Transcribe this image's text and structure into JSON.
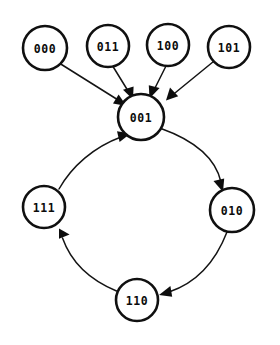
{
  "diagram": {
    "kind": "state-transition-diagram",
    "title": "",
    "background_color": "#ffffff",
    "node_fill": "#ffffff",
    "node_stroke": "#101010",
    "edge_color": "#141414",
    "label_color": "#0b0b0b",
    "nodes": [
      {
        "id": "n000",
        "label": "000",
        "cx": 45,
        "cy": 48,
        "r": 22,
        "row": "top"
      },
      {
        "id": "n011",
        "label": "011",
        "cx": 108,
        "cy": 46,
        "r": 21,
        "row": "top"
      },
      {
        "id": "n100",
        "label": "100",
        "cx": 168,
        "cy": 45,
        "r": 21,
        "row": "top"
      },
      {
        "id": "n101",
        "label": "101",
        "cx": 229,
        "cy": 47,
        "r": 21,
        "row": "top"
      },
      {
        "id": "n001",
        "label": "001",
        "cx": 141,
        "cy": 117,
        "r": 23,
        "row": "center"
      },
      {
        "id": "n111",
        "label": "111",
        "cx": 44,
        "cy": 207,
        "r": 21,
        "row": "cycle"
      },
      {
        "id": "n010",
        "label": "010",
        "cx": 232,
        "cy": 210,
        "r": 22,
        "row": "cycle"
      },
      {
        "id": "n110",
        "label": "110",
        "cx": 137,
        "cy": 300,
        "r": 21,
        "row": "cycle"
      }
    ],
    "edges": [
      {
        "id": "e1",
        "from": "000",
        "to": "001",
        "style": "straight",
        "arrowhead": "large"
      },
      {
        "id": "e2",
        "from": "011",
        "to": "001",
        "style": "straight",
        "arrowhead": "large"
      },
      {
        "id": "e3",
        "from": "100",
        "to": "001",
        "style": "straight",
        "arrowhead": "large"
      },
      {
        "id": "e4",
        "from": "101",
        "to": "001",
        "style": "straight",
        "arrowhead": "large"
      },
      {
        "id": "e5",
        "from": "001",
        "to": "010",
        "style": "curve",
        "arrowhead": "large"
      },
      {
        "id": "e6",
        "from": "010",
        "to": "110",
        "style": "curve",
        "arrowhead": "large"
      },
      {
        "id": "e7",
        "from": "110",
        "to": "111",
        "style": "curve",
        "arrowhead": "large"
      },
      {
        "id": "e8",
        "from": "111",
        "to": "001",
        "style": "curve",
        "arrowhead": "large"
      }
    ]
  }
}
